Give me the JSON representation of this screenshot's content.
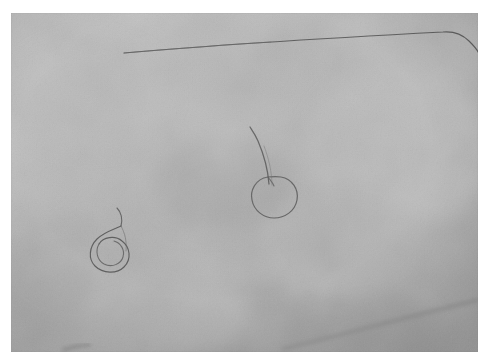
{
  "image": {
    "kind": "photograph",
    "subject": "close-up of pale skin with three loose hairs",
    "color_mode": "grayscale",
    "canvas": {
      "width": 489,
      "height": 364
    },
    "paper_border": {
      "color": "#ffffff",
      "left": 11,
      "top": 13,
      "right": 11,
      "bottom": 12
    },
    "photo_area": {
      "x": 11,
      "y": 13,
      "width": 467,
      "height": 339
    },
    "palette": {
      "paper_white": "#ffffff",
      "skin_light": "#c4c4c4",
      "skin_mid": "#b2b2b2",
      "skin_dark": "#9c9c9c",
      "skin_shadow": "#8e8e8e",
      "hair_dark": "#4a4a4a",
      "hair_mid": "#6d6d6d",
      "hair_faint": "#8a8a8a"
    },
    "objects": [
      {
        "id": "hair-top-long",
        "label": "long straight hair across upper area",
        "description": "nearly horizontal strand running left to right with a downward bend near the right edge",
        "start": {
          "x": 124,
          "y": 52
        },
        "bend": {
          "x": 443,
          "y": 32
        },
        "end": {
          "x": 479,
          "y": 51
        },
        "stroke": "#5a5a5a",
        "thickness": 1.1
      },
      {
        "id": "hair-coil-left",
        "label": "double-coiled spiral hair, lower left",
        "description": "hair wound into two overlapping loops with a short tail curling up and to the right",
        "center": {
          "x": 106,
          "y": 240
        },
        "loop_width": 32,
        "loop_height": 30,
        "tail_tip": {
          "x": 120,
          "y": 207
        },
        "stroke": "#585858",
        "thickness": 1.1
      },
      {
        "id": "hair-loop-center",
        "label": "heart-shaped looped hair with curving tail",
        "description": "single closed loop resembling a cherry or heart, with a long tail sweeping up and to the left",
        "center": {
          "x": 268,
          "y": 187
        },
        "loop_width": 36,
        "loop_height": 30,
        "tail_tip": {
          "x": 252,
          "y": 136
        },
        "stroke": "#5c5c5c",
        "thickness": 1.2
      },
      {
        "id": "crease-bottom-right",
        "label": "faint diagonal skin crease, lower right",
        "start": {
          "x": 283,
          "y": 347
        },
        "end": {
          "x": 478,
          "y": 300
        },
        "stroke": "#8d8d8d",
        "thickness": 2.0
      },
      {
        "id": "mark-bottom-left",
        "label": "small dark streak near bottom edge",
        "start": {
          "x": 63,
          "y": 349
        },
        "end": {
          "x": 88,
          "y": 345
        },
        "stroke": "#7b7b7b",
        "thickness": 1.6
      }
    ],
    "tone_patches": [
      {
        "id": "patch-center-dark",
        "cx": 225,
        "cy": 185,
        "rx": 70,
        "ry": 48,
        "tone": "#a6a6a6"
      },
      {
        "id": "patch-upper-left",
        "cx": 90,
        "cy": 95,
        "rx": 80,
        "ry": 55,
        "tone": "#b8b8b8"
      },
      {
        "id": "patch-lower-left",
        "cx": 70,
        "cy": 275,
        "rx": 75,
        "ry": 60,
        "tone": "#acacac"
      },
      {
        "id": "patch-right-light",
        "cx": 400,
        "cy": 150,
        "rx": 95,
        "ry": 80,
        "tone": "#c0c0c0"
      },
      {
        "id": "patch-bottom-shadow",
        "cx": 300,
        "cy": 330,
        "rx": 140,
        "ry": 50,
        "tone": "#a2a2a2"
      },
      {
        "id": "patch-top-right",
        "cx": 420,
        "cy": 45,
        "rx": 80,
        "ry": 40,
        "tone": "#bcbcbc"
      }
    ]
  }
}
